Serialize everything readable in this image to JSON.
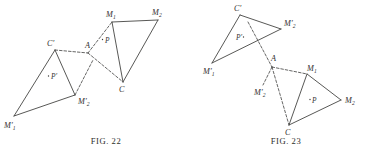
{
  "page": {
    "background_color": "#ffffff",
    "ink_color": "#3a3a38",
    "kind": "geometry-figure-plate"
  },
  "figures": [
    {
      "id": "fig-22",
      "caption": "FIG. 22",
      "caption_number": "22",
      "description": "Two triangles linked through point A; left triangle M'1 C' M'2 with interior point P', right triangle M1 C M2 with interior point P",
      "labels": {
        "c_prime": "C′",
        "a": "A",
        "m1_prime": "M′₁",
        "m2_prime": "M′₂",
        "p_prime": "P′",
        "m1": "M₁",
        "m2": "M₂",
        "c": "C",
        "p": "P"
      },
      "points": {
        "C_prime": [
          55,
          50
        ],
        "A": [
          88,
          53
        ],
        "M1_prime": [
          14,
          116
        ],
        "M2_prime": [
          75,
          95
        ],
        "M1": [
          112,
          22
        ],
        "M2": [
          158,
          20
        ],
        "C": [
          123,
          82
        ],
        "P_marker": [
          105,
          40
        ],
        "P_prime_marker": [
          51,
          76
        ]
      }
    },
    {
      "id": "fig-23",
      "caption": "FIG. 23",
      "caption_number": "23",
      "description": "Two triangles meeting at point A; upper-left triangle M'1 C' M'2 with interior point P', lower-right triangle M1 C M2 with interior point P",
      "labels": {
        "c_prime": "C′",
        "a": "A",
        "m1_prime": "M′₁",
        "m2_prime": "M′₂",
        "p_prime": "P′",
        "m1": "M₁",
        "m2": "M₂",
        "c": "C",
        "p": "P"
      },
      "points": {
        "C_prime": [
          240,
          15
        ],
        "M2_prime": [
          281,
          29
        ],
        "M1_prime": [
          212,
          63
        ],
        "A": [
          272,
          67
        ],
        "M2_prime_lower": [
          262,
          86
        ],
        "M1": [
          307,
          74
        ],
        "M2": [
          341,
          100
        ],
        "C": [
          289,
          125
        ],
        "P_prime_marker": [
          237,
          38
        ],
        "P_marker": [
          313,
          100
        ]
      }
    }
  ]
}
